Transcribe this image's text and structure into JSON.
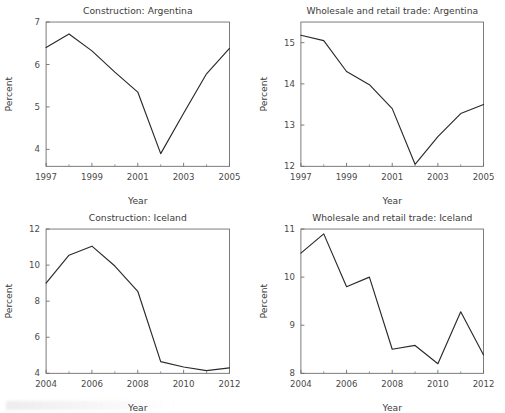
{
  "figure": {
    "background": "#ffffff",
    "line_color": "#2a2a2a",
    "axis_color": "#6e6e6e",
    "text_color": "#3b3b3b",
    "panel_count": 4
  },
  "chart_data": [
    {
      "type": "line",
      "panel": "top-left",
      "title": "Construction: Argentina",
      "xlabel": "Year",
      "ylabel": "Percent",
      "x": [
        1997,
        1998,
        1999,
        2000,
        2001,
        2002,
        2003,
        2004,
        2005
      ],
      "values": [
        6.4,
        6.72,
        6.32,
        5.82,
        5.35,
        3.9,
        4.85,
        5.78,
        6.38
      ],
      "xlim": [
        1997,
        2005
      ],
      "ylim": [
        3.6,
        7.0
      ],
      "xticks": [
        1997,
        1999,
        2001,
        2003,
        2005
      ],
      "xticklabels": [
        "1997",
        "1999",
        "2001",
        "2003",
        "2005"
      ],
      "xminorticks": [
        1998,
        2000,
        2002,
        2004
      ],
      "yticks": [
        4,
        5,
        6,
        7
      ],
      "yticklabels": [
        "4",
        "5",
        "6",
        "7"
      ],
      "grid": false,
      "legend": false
    },
    {
      "type": "line",
      "panel": "top-right",
      "title": "Wholesale and retail trade: Argentina",
      "xlabel": "Year",
      "ylabel": "Percent",
      "x": [
        1997,
        1998,
        1999,
        2000,
        2001,
        2002,
        2003,
        2004,
        2005
      ],
      "values": [
        15.18,
        15.05,
        14.3,
        13.98,
        13.4,
        12.05,
        12.72,
        13.28,
        13.5
      ],
      "xlim": [
        1997,
        2005
      ],
      "ylim": [
        12.0,
        15.5
      ],
      "xticks": [
        1997,
        1999,
        2001,
        2003,
        2005
      ],
      "xticklabels": [
        "1997",
        "1999",
        "2001",
        "2003",
        "2005"
      ],
      "xminorticks": [
        1998,
        2000,
        2002,
        2004
      ],
      "yticks": [
        12,
        13,
        14,
        15
      ],
      "yticklabels": [
        "12",
        "13",
        "14",
        "15"
      ],
      "grid": false,
      "legend": false
    },
    {
      "type": "line",
      "panel": "bottom-left",
      "title": "Construction: Iceland",
      "xlabel": "Year",
      "ylabel": "Percent",
      "x": [
        2004,
        2005,
        2006,
        2007,
        2008,
        2009,
        2010,
        2011,
        2012
      ],
      "values": [
        9.0,
        10.55,
        11.05,
        9.95,
        8.55,
        4.65,
        4.35,
        4.15,
        4.3
      ],
      "xlim": [
        2004,
        2012
      ],
      "ylim": [
        4.0,
        12.0
      ],
      "xticks": [
        2004,
        2006,
        2008,
        2010,
        2012
      ],
      "xticklabels": [
        "2004",
        "2006",
        "2008",
        "2010",
        "2012"
      ],
      "xminorticks": [
        2005,
        2007,
        2009,
        2011
      ],
      "yticks": [
        4,
        6,
        8,
        10,
        12
      ],
      "yticklabels": [
        "4",
        "6",
        "8",
        "10",
        "12"
      ],
      "grid": false,
      "legend": false
    },
    {
      "type": "line",
      "panel": "bottom-right",
      "title": "Wholesale and retail trade: Iceland",
      "xlabel": "Year",
      "ylabel": "Percent",
      "x": [
        2004,
        2005,
        2006,
        2007,
        2008,
        2009,
        2010,
        2011,
        2012
      ],
      "values": [
        10.5,
        10.9,
        9.8,
        10.0,
        8.5,
        8.58,
        8.2,
        9.28,
        8.38
      ],
      "xlim": [
        2004,
        2012
      ],
      "ylim": [
        8.0,
        11.0
      ],
      "xticks": [
        2004,
        2006,
        2008,
        2010,
        2012
      ],
      "xticklabels": [
        "2004",
        "2006",
        "2008",
        "2010",
        "2012"
      ],
      "xminorticks": [
        2005,
        2007,
        2009,
        2011
      ],
      "yticks": [
        8,
        9,
        10,
        11
      ],
      "yticklabels": [
        "8",
        "9",
        "10",
        "11"
      ],
      "grid": false,
      "legend": false
    }
  ]
}
